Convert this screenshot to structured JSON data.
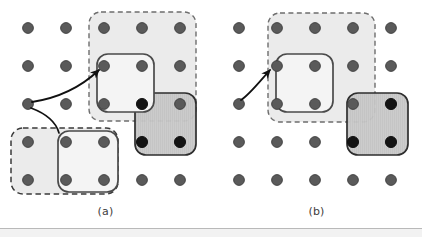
{
  "figure": {
    "width": 422,
    "height": 237,
    "background": "#ffffff",
    "footer_rule_color": "#b9b9b9",
    "footer_band_color": "#f2f2f2",
    "footer_rule_y": 228,
    "panels": [
      {
        "id": "panel-a",
        "caption": "(a)",
        "origin_x": 0
      },
      {
        "id": "panel-b",
        "caption": "(b)",
        "origin_x": 211
      }
    ]
  },
  "grid": {
    "description": "5 x 5 lattice of dots",
    "columns": 5,
    "rows": 5,
    "spacing_x": 38,
    "spacing_y": 38,
    "first_x_panel_a": 28,
    "first_x_panel_b": 239,
    "first_y": 28,
    "dot_radius": 5.5,
    "dot_fill_normal": "#5a5a5a",
    "dot_fill_dark": "#141414",
    "dot_stroke": "#3c3c3c"
  },
  "colors": {
    "dashed_region_fill": "#ebebeb",
    "dashed_region_stroke": "#6e6e6e",
    "solid_light_fill": "#f2f2f2",
    "solid_light_stroke": "#4a4a4a",
    "solid_dark_fill": "#c9c9c9",
    "solid_dark_stroke": "#2e2e2e",
    "arrow_stroke": "#111111",
    "caption_color": "#3d3d3d"
  },
  "panel_a": {
    "label": "(a)",
    "dashed_region": {
      "name": "dashed-region-top",
      "x": 89,
      "y": 12,
      "w": 107,
      "h": 109,
      "r": 12
    },
    "solid_light_box": {
      "name": "solid-light-box-top",
      "x": 97,
      "y": 54,
      "w": 57,
      "h": 58,
      "r": 11
    },
    "solid_dark_box": {
      "name": "solid-dark-box",
      "x": 135,
      "y": 93,
      "w": 61,
      "h": 62,
      "r": 11
    },
    "dashed_region_bottom": {
      "name": "dashed-region-bottom",
      "x": 11,
      "y": 128,
      "w": 107,
      "h": 66,
      "r": 12
    },
    "solid_light_box_bottom": {
      "name": "solid-light-box-bottom",
      "x": 58,
      "y": 131,
      "w": 60,
      "h": 61,
      "r": 11
    },
    "dark_dots": [
      {
        "cx": 142,
        "cy": 104
      },
      {
        "cx": 142,
        "cy": 142
      },
      {
        "cx": 180,
        "cy": 142
      }
    ],
    "arrows": [
      {
        "name": "arrow-to-top-box",
        "path": "M 28,104 C 56,100 80,88 100,70",
        "has_arrowhead": true
      },
      {
        "name": "arrow-to-bottom-box",
        "path": "M 30,108 C 46,114 56,124 59,136",
        "has_arrowhead": false
      }
    ],
    "anchor_dot": {
      "cx": 28,
      "cy": 104
    }
  },
  "panel_b": {
    "label": "(b)",
    "dashed_region": {
      "name": "dashed-region-top",
      "x": 268,
      "y": 13,
      "w": 107,
      "h": 109,
      "r": 12
    },
    "solid_light_box": {
      "name": "solid-light-box-top",
      "x": 276,
      "y": 54,
      "w": 57,
      "h": 58,
      "r": 11
    },
    "solid_dark_box": {
      "name": "solid-dark-box",
      "x": 347,
      "y": 93,
      "w": 61,
      "h": 62,
      "r": 11
    },
    "dark_dots": [
      {
        "cx": 391,
        "cy": 104
      },
      {
        "cx": 353,
        "cy": 142
      },
      {
        "cx": 391,
        "cy": 142
      }
    ],
    "arrows": [
      {
        "name": "arrow-to-top-box",
        "path": "M 239,104 C 248,100 258,90 272,70",
        "has_arrowhead": true
      }
    ],
    "anchor_dot": {
      "cx": 239,
      "cy": 104
    }
  }
}
